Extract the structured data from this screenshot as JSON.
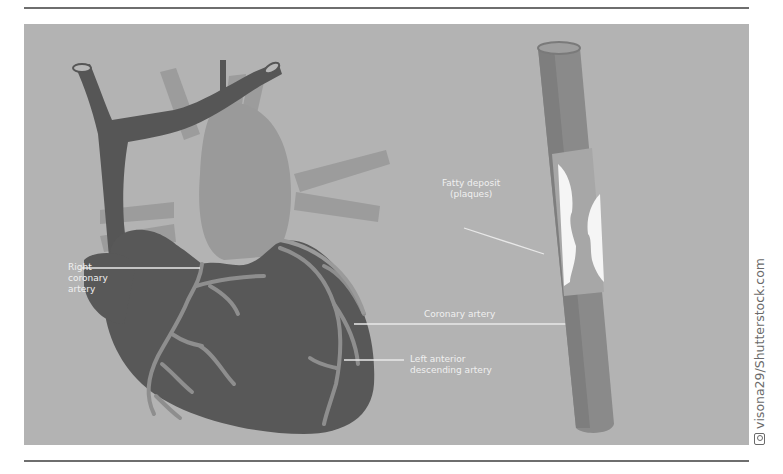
{
  "illustration": {
    "subject": "Heart with coronary arteries and artery cross-section showing plaque",
    "background_color": "#b3b3b3",
    "heart_color": "#5a5a5a",
    "vessel_color": "#8f8f8f",
    "labels": {
      "right_coronary_artery": [
        "Right",
        "coronary",
        "artery"
      ],
      "fatty_deposit": [
        "Fatty deposit",
        "(plaques)"
      ],
      "coronary_artery": "Coronary artery",
      "left_anterior_descending_artery": [
        "Left anterior",
        "descending artery"
      ]
    }
  },
  "credit": {
    "icon": "camera-icon",
    "text": "visona29/Shutterstock.com"
  }
}
